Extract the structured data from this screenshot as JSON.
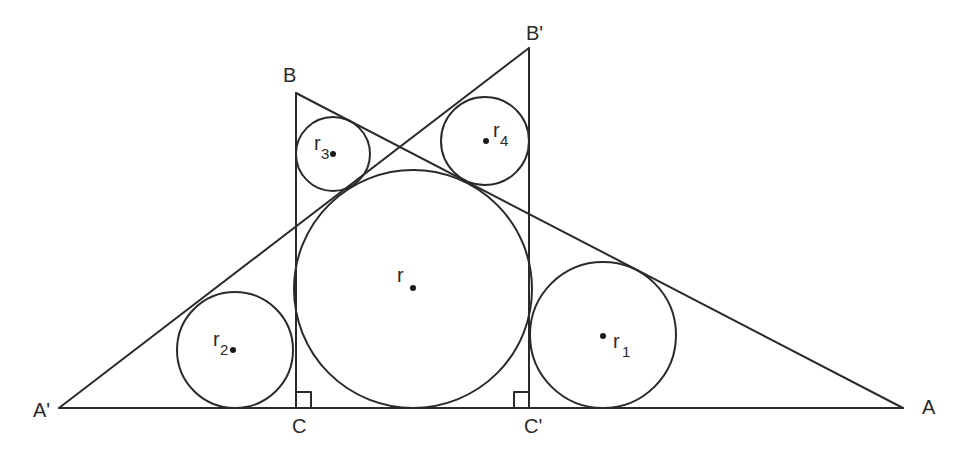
{
  "diagram": {
    "stroke_color": "#2a2a2a",
    "background": "#ffffff",
    "points": {
      "A_prime": {
        "label": "A'",
        "x": 59,
        "y": 408
      },
      "A": {
        "label": "A",
        "x": 903,
        "y": 408
      },
      "B": {
        "label": "B",
        "x": 296,
        "y": 93
      },
      "B_prime": {
        "label": "B'",
        "x": 529,
        "y": 48
      },
      "C": {
        "label": "C",
        "x": 296,
        "y": 408
      },
      "C_prime": {
        "label": "C'",
        "x": 529,
        "y": 408
      }
    },
    "circles": {
      "r": {
        "label": "r",
        "sub": "",
        "cx": 413,
        "cy": 289,
        "radius": 119
      },
      "r1": {
        "label": "r",
        "sub": "1",
        "cx": 603,
        "cy": 335,
        "radius": 73
      },
      "r2": {
        "label": "r",
        "sub": "2",
        "cx": 235,
        "cy": 350,
        "radius": 58
      },
      "r3": {
        "label": "r",
        "sub": "3",
        "cx": 333,
        "cy": 154,
        "radius": 37
      },
      "r4": {
        "label": "r",
        "sub": "4",
        "cx": 485,
        "cy": 141,
        "radius": 44
      }
    },
    "right_angle_markers": [
      "C",
      "C'"
    ]
  }
}
